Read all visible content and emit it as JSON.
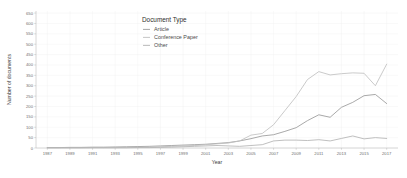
{
  "chart_data": {
    "type": "line",
    "title": "",
    "xlabel": "Year",
    "ylabel": "Number of documents",
    "legend_title": "Document Type",
    "legend_position": "top-center-inside",
    "grid": true,
    "xlim": [
      1986,
      2018
    ],
    "ylim": [
      0,
      660
    ],
    "yticks": [
      0,
      50,
      100,
      150,
      200,
      250,
      300,
      350,
      400,
      450,
      500,
      550,
      600,
      650
    ],
    "ytick_labels": [
      "0",
      "50",
      "100",
      "150",
      "200",
      "250",
      "300",
      "350",
      "400",
      "450",
      "500",
      "550",
      "600",
      "650"
    ],
    "xticks": [
      1987,
      1989,
      1991,
      1993,
      1995,
      1997,
      1999,
      2001,
      2003,
      2005,
      2007,
      2009,
      2011,
      2013,
      2015,
      2017
    ],
    "xtick_labels": [
      "1987",
      "1989",
      "1991",
      "1993",
      "1995",
      "1997",
      "1999",
      "2001",
      "2003",
      "2005",
      "2007",
      "2009",
      "2011",
      "2013",
      "2015",
      "2017"
    ],
    "x": [
      1987,
      1988,
      1989,
      1990,
      1991,
      1992,
      1993,
      1994,
      1995,
      1996,
      1997,
      1998,
      1999,
      2000,
      2001,
      2002,
      2003,
      2004,
      2005,
      2006,
      2007,
      2008,
      2009,
      2010,
      2011,
      2012,
      2013,
      2014,
      2015,
      2016,
      2017
    ],
    "series": [
      {
        "name": "Article",
        "color": "#9a9a9a",
        "values": [
          2,
          2,
          3,
          3,
          4,
          4,
          5,
          6,
          7,
          8,
          10,
          12,
          14,
          16,
          18,
          22,
          26,
          34,
          45,
          58,
          64,
          80,
          98,
          132,
          160,
          148,
          196,
          220,
          252,
          258,
          214
        ]
      },
      {
        "name": "Conference Paper",
        "color": "#c0c0c0",
        "values": [
          1,
          1,
          1,
          1,
          2,
          2,
          2,
          3,
          3,
          4,
          6,
          8,
          10,
          12,
          16,
          20,
          24,
          34,
          62,
          70,
          112,
          180,
          248,
          330,
          368,
          352,
          358,
          362,
          360,
          300,
          404
        ]
      },
      {
        "name": "Other",
        "color": "#b4b4b4",
        "values": [
          1,
          1,
          1,
          1,
          1,
          1,
          1,
          1,
          2,
          2,
          3,
          4,
          6,
          8,
          10,
          12,
          10,
          8,
          12,
          16,
          34,
          38,
          38,
          36,
          40,
          34,
          46,
          58,
          44,
          50,
          46
        ]
      }
    ],
    "note_extra_series_tail": {
      "Article": 214,
      "Conference Paper_peak_2017": 644
    }
  },
  "legend": {
    "title": "Document Type",
    "entries": [
      {
        "label": "Article",
        "color": "#9a9a9a"
      },
      {
        "label": "Conference Paper",
        "color": "#c0c0c0"
      },
      {
        "label": "Other",
        "color": "#b4b4b4"
      }
    ]
  },
  "axes": {
    "x_title": "Year",
    "y_title": "Number of documents"
  }
}
